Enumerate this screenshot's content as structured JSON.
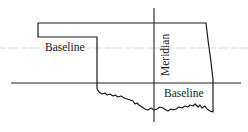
{
  "diagram": {
    "labels": {
      "panhandle_baseline": "Baseline",
      "meridian": "Meridian",
      "main_baseline": "Baseline"
    },
    "colors": {
      "line": "#1a1a1a",
      "background": "#ffffff"
    }
  }
}
